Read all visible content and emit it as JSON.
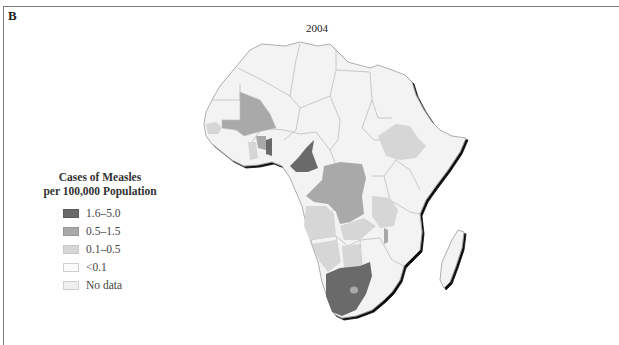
{
  "figure": {
    "panel_label": "B",
    "year": "2004"
  },
  "legend": {
    "title_line1": "Cases of Measles",
    "title_line2": "per 100,000 Population",
    "items": [
      {
        "label": "1.6–5.0",
        "color": "#6a6a6a",
        "border": "#5a5a5a"
      },
      {
        "label": "0.5–1.5",
        "color": "#a9a9a9",
        "border": "#999999"
      },
      {
        "label": "0.1–0.5",
        "color": "#d6d6d6",
        "border": "#c8c8c8"
      },
      {
        "label": "<0.1",
        "color": "#fbfbfb",
        "border": "#cfcfcf"
      },
      {
        "label": "No data",
        "color": "#efefef",
        "border": "#cfcfcf"
      }
    ]
  },
  "map": {
    "region": "Africa",
    "fill_colors": {
      "high": "#6a6a6a",
      "medium": "#a9a9a9",
      "low": "#d6d6d6",
      "very_low": "#fbfbfb",
      "no_data": "#efefef",
      "border": "#b8b8b8",
      "coast_shadow": "#111111"
    }
  }
}
